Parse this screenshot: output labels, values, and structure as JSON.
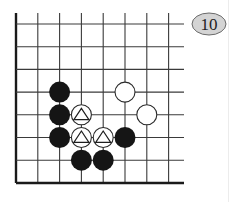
{
  "diagram": {
    "type": "go-board-fragment",
    "label": "10",
    "colors": {
      "line": "#3a3a3a",
      "edge": "#1a1a1a",
      "black_stone": "#151515",
      "white_stone_fill": "#ffffff",
      "white_stone_stroke": "#2a2a2a",
      "badge_fill": "#d4d4d4",
      "badge_stroke": "#6a6a6a",
      "badge_text": "#222222"
    },
    "grid": {
      "x": [
        16,
        37.8,
        59.6,
        81.4,
        103.2,
        125,
        146.8,
        168.6
      ],
      "y": [
        24,
        46.7,
        69.4,
        92.1,
        114.8,
        137.5,
        160.2,
        183
      ],
      "right_extent": 184,
      "top_extent": 13,
      "edges": [
        "left",
        "bottom"
      ]
    },
    "stones": [
      {
        "color": "black",
        "col": 2,
        "row": 3,
        "marker": ""
      },
      {
        "color": "black",
        "col": 2,
        "row": 4,
        "marker": ""
      },
      {
        "color": "black",
        "col": 2,
        "row": 5,
        "marker": ""
      },
      {
        "color": "black",
        "col": 3,
        "row": 6,
        "marker": ""
      },
      {
        "color": "black",
        "col": 4,
        "row": 6,
        "marker": ""
      },
      {
        "color": "black",
        "col": 5,
        "row": 5,
        "marker": ""
      },
      {
        "color": "white",
        "col": 5,
        "row": 3,
        "marker": ""
      },
      {
        "color": "white",
        "col": 6,
        "row": 4,
        "marker": ""
      },
      {
        "color": "white",
        "col": 3,
        "row": 4,
        "marker": "triangle"
      },
      {
        "color": "white",
        "col": 3,
        "row": 5,
        "marker": "triangle"
      },
      {
        "color": "white",
        "col": 4,
        "row": 5,
        "marker": "triangle"
      }
    ],
    "stone_radius": 10
  }
}
